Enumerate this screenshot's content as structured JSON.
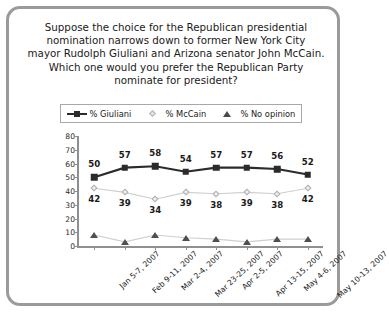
{
  "frame": {
    "border_color": "#9a9a9a"
  },
  "title": {
    "lines": [
      "Suppose the choice for the Republican presidential",
      "nomination narrows down to former New York City",
      "mayor Rudolph Giuliani and Arizona senator John McCain.",
      "Which one would you prefer the Republican Party",
      "nominate for president?"
    ]
  },
  "legend": {
    "items": [
      {
        "label": "% Giuliani",
        "marker": "filled-square-icon",
        "color": "#2b2b2b"
      },
      {
        "label": "% McCain",
        "marker": "open-diamond-icon",
        "color": "#c9c9c9"
      },
      {
        "label": "% No opinion",
        "marker": "filled-triangle-icon",
        "color": "#4f4f4f"
      }
    ]
  },
  "chart_data": {
    "type": "line",
    "xlabel": "",
    "ylabel": "",
    "ylim": [
      0,
      80
    ],
    "yticks": [
      0,
      10,
      20,
      30,
      40,
      50,
      60,
      70,
      80
    ],
    "grid": false,
    "legend_position": "top",
    "categories": [
      "Jan 5-7, 2007",
      "Feb 9-11, 2007",
      "Mar 2-4, 2007",
      "Mar 23-25, 2007",
      "Apr 2-5, 2007",
      "Apr 13-15, 2007",
      "May 4-6, 2007",
      "May 10-13, 2007"
    ],
    "series": [
      {
        "name": "% Giuliani",
        "color": "#2b2b2b",
        "marker": "square",
        "labels_shown": true,
        "label_position": "above",
        "values": [
          50,
          57,
          58,
          54,
          57,
          57,
          56,
          52
        ]
      },
      {
        "name": "% McCain",
        "color": "#c9c9c9",
        "marker": "diamond",
        "labels_shown": true,
        "label_position": "below",
        "values": [
          42,
          39,
          34,
          39,
          38,
          39,
          38,
          42
        ]
      },
      {
        "name": "% No opinion",
        "color": "#4f4f4f",
        "marker": "triangle",
        "labels_shown": false,
        "label_position": "none",
        "values": [
          8,
          3,
          8,
          6,
          5,
          3,
          5,
          5
        ]
      }
    ]
  }
}
